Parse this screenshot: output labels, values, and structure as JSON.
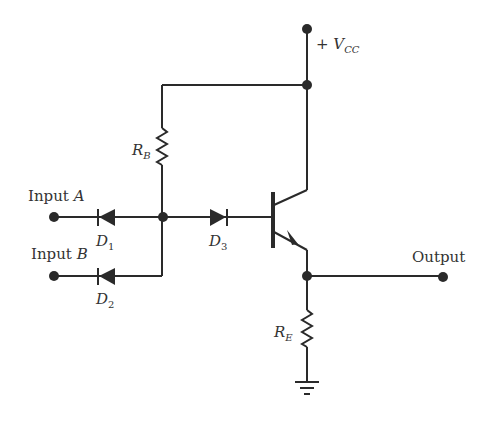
{
  "diagram": {
    "type": "circuit-schematic",
    "labels": {
      "vcc_plus": "+",
      "vcc_main": "V",
      "vcc_sub": "CC",
      "rb_main": "R",
      "rb_sub": "B",
      "re_main": "R",
      "re_sub": "E",
      "input_a_text": "Input",
      "input_a_letter": "A",
      "input_b_text": "Input",
      "input_b_letter": "B",
      "d1_main": "D",
      "d1_sub": "1",
      "d2_main": "D",
      "d2_sub": "2",
      "d3_main": "D",
      "d3_sub": "3",
      "output": "Output"
    },
    "components": [
      {
        "id": "D1",
        "type": "diode",
        "orientation": "cathode-left"
      },
      {
        "id": "D2",
        "type": "diode",
        "orientation": "cathode-left"
      },
      {
        "id": "D3",
        "type": "diode",
        "orientation": "cathode-right"
      },
      {
        "id": "RB",
        "type": "resistor"
      },
      {
        "id": "RE",
        "type": "resistor"
      },
      {
        "id": "Q",
        "type": "npn-transistor"
      },
      {
        "id": "GND",
        "type": "ground"
      }
    ],
    "colors": {
      "line": "#2a2a2a",
      "text": "#333333",
      "background": "#ffffff"
    }
  }
}
